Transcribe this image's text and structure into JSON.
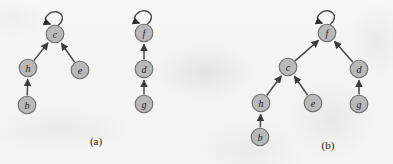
{
  "figure": {
    "background_color": "#f5f5f3",
    "node_fill": "#b9b9b9",
    "node_stroke": "#6e6e6e",
    "edge_color": "#4a4a4a",
    "label_color": "#1e1e1e",
    "node_radius": 8.8
  },
  "panels": [
    {
      "id": "panel-a",
      "caption": "(a)",
      "caption_x": 96,
      "caption_y": 141,
      "nodes": [
        {
          "id": "a-c",
          "label": "c",
          "cx": 55,
          "cy": 34,
          "self_loop": true
        },
        {
          "id": "a-h",
          "label": "h",
          "cx": 28,
          "cy": 68,
          "self_loop": false
        },
        {
          "id": "a-e",
          "label": "e",
          "cx": 80,
          "cy": 70,
          "self_loop": false
        },
        {
          "id": "a-b",
          "label": "b",
          "cx": 27,
          "cy": 105,
          "self_loop": false
        },
        {
          "id": "a-f",
          "label": "f",
          "cx": 144,
          "cy": 33,
          "self_loop": true
        },
        {
          "id": "a-d",
          "label": "d",
          "cx": 144,
          "cy": 69,
          "self_loop": false
        },
        {
          "id": "a-g",
          "label": "g",
          "cx": 144,
          "cy": 104,
          "self_loop": false
        }
      ],
      "edges": [
        {
          "id": "a-h-to-c",
          "from": "a-h",
          "to": "a-c"
        },
        {
          "id": "a-e-to-c",
          "from": "a-e",
          "to": "a-c"
        },
        {
          "id": "a-b-to-h",
          "from": "a-b",
          "to": "a-h"
        },
        {
          "id": "a-d-to-f",
          "from": "a-d",
          "to": "a-f"
        },
        {
          "id": "a-g-to-d",
          "from": "a-g",
          "to": "a-d"
        }
      ]
    },
    {
      "id": "panel-b",
      "caption": "(b)",
      "caption_x": 328,
      "caption_y": 145,
      "nodes": [
        {
          "id": "b-f",
          "label": "f",
          "cx": 327,
          "cy": 33,
          "self_loop": true
        },
        {
          "id": "b-c",
          "label": "c",
          "cx": 288,
          "cy": 67,
          "self_loop": false
        },
        {
          "id": "b-d",
          "label": "d",
          "cx": 359,
          "cy": 69,
          "self_loop": false
        },
        {
          "id": "b-h",
          "label": "h",
          "cx": 261,
          "cy": 103,
          "self_loop": false
        },
        {
          "id": "b-e",
          "label": "e",
          "cx": 313,
          "cy": 103,
          "self_loop": false
        },
        {
          "id": "b-g",
          "label": "g",
          "cx": 359,
          "cy": 104,
          "self_loop": false
        },
        {
          "id": "b-b",
          "label": "b",
          "cx": 260,
          "cy": 137,
          "self_loop": false
        }
      ],
      "edges": [
        {
          "id": "b-c-to-f",
          "from": "b-c",
          "to": "b-f"
        },
        {
          "id": "b-d-to-f",
          "from": "b-d",
          "to": "b-f"
        },
        {
          "id": "b-h-to-c",
          "from": "b-h",
          "to": "b-c"
        },
        {
          "id": "b-e-to-c",
          "from": "b-e",
          "to": "b-c"
        },
        {
          "id": "b-g-to-d",
          "from": "b-g",
          "to": "b-d"
        },
        {
          "id": "b-b-to-h",
          "from": "b-b",
          "to": "b-h"
        }
      ]
    }
  ]
}
